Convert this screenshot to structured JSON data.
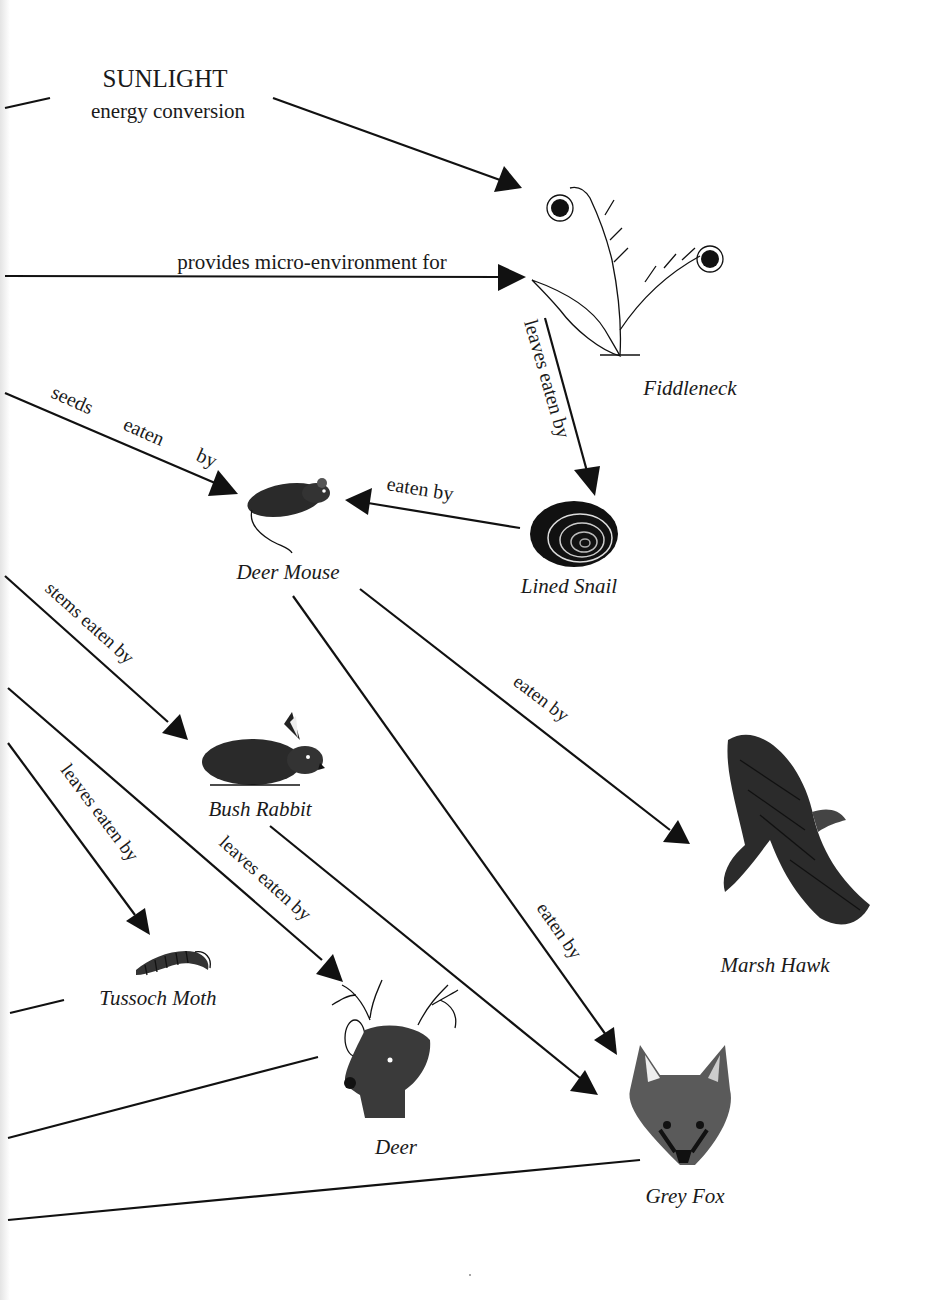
{
  "diagram": {
    "type": "food-web",
    "source": {
      "title": "SUNLIGHT",
      "subtitle": "energy conversion"
    },
    "organisms": [
      {
        "id": "fiddleneck",
        "name": "Fiddleneck",
        "icon": "fiddleneck-plant-illustration"
      },
      {
        "id": "deer_mouse",
        "name": "Deer Mouse",
        "icon": "deer-mouse-illustration"
      },
      {
        "id": "lined_snail",
        "name": "Lined Snail",
        "icon": "snail-illustration"
      },
      {
        "id": "bush_rabbit",
        "name": "Bush Rabbit",
        "icon": "rabbit-illustration"
      },
      {
        "id": "marsh_hawk",
        "name": "Marsh Hawk",
        "icon": "hawk-illustration"
      },
      {
        "id": "tussock_moth",
        "name": "Tussoch Moth",
        "icon": "caterpillar-illustration"
      },
      {
        "id": "deer",
        "name": "Deer",
        "icon": "deer-head-illustration"
      },
      {
        "id": "grey_fox",
        "name": "Grey Fox",
        "icon": "fox-head-illustration"
      }
    ],
    "edges": [
      {
        "from": "sunlight",
        "to": "fiddleneck",
        "label": ""
      },
      {
        "from": "offpage",
        "to": "fiddleneck",
        "label": "provides micro-environment for"
      },
      {
        "from": "fiddleneck",
        "to": "lined_snail",
        "label": "leaves eaten by"
      },
      {
        "from": "offpage",
        "to": "deer_mouse",
        "label": "seeds    eaten    by"
      },
      {
        "from": "lined_snail",
        "to": "deer_mouse",
        "label": "eaten by"
      },
      {
        "from": "offpage",
        "to": "bush_rabbit",
        "label": "stems eaten by"
      },
      {
        "from": "deer_mouse",
        "to": "marsh_hawk",
        "label": "eaten by"
      },
      {
        "from": "deer_mouse",
        "to": "grey_fox",
        "label": "eaten by"
      },
      {
        "from": "offpage",
        "to": "tussock_moth",
        "label": "leaves eaten by"
      },
      {
        "from": "offpage",
        "to": "deer",
        "label": "leaves eaten by"
      },
      {
        "from": "bush_rabbit",
        "to": "grey_fox",
        "label": ""
      },
      {
        "from": "tussock_moth",
        "to": "offpage",
        "label": ""
      },
      {
        "from": "deer",
        "to": "offpage",
        "label": ""
      },
      {
        "from": "grey_fox",
        "to": "offpage",
        "label": ""
      }
    ]
  },
  "labels": {
    "sunlight": "SUNLIGHT",
    "energy": "energy conversion",
    "micro": "provides micro-environment for",
    "leaves_snail": "leaves eaten by",
    "seeds": "seeds",
    "seeds_eaten": "eaten",
    "seeds_by": "by",
    "snail_mouse": "eaten by",
    "stems": "stems eaten by",
    "mouse_hawk": "eaten by",
    "mouse_fox": "eaten by",
    "leaves_moth": "leaves eaten by",
    "leaves_deer": "leaves eaten by",
    "fiddleneck": "Fiddleneck",
    "deer_mouse": "Deer Mouse",
    "lined_snail": "Lined Snail",
    "bush_rabbit": "Bush Rabbit",
    "marsh_hawk": "Marsh Hawk",
    "tussock_moth": "Tussoch Moth",
    "deer": "Deer",
    "grey_fox": "Grey Fox"
  }
}
